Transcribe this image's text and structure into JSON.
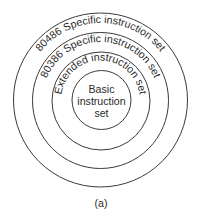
{
  "diagram": {
    "type": "concentric-circles",
    "colors": {
      "stroke": "#3a3a3a",
      "text": "#2a2a2a",
      "background": "#ffffff"
    },
    "center": {
      "x": 100.5,
      "y": 100
    },
    "rings": [
      {
        "id": "ring-80486",
        "label": "80486 Specific instruction set",
        "radius": 87,
        "text_radius": 77
      },
      {
        "id": "ring-80386",
        "label": "80386 Specific instruction set",
        "radius": 68,
        "text_radius": 58
      },
      {
        "id": "ring-extended",
        "label": "Extended instruction set",
        "radius": 49,
        "text_radius": 39.5
      }
    ],
    "core": {
      "radius": 30,
      "lines": [
        "Basic",
        "instruction",
        "set"
      ]
    },
    "caption": "(a)"
  }
}
